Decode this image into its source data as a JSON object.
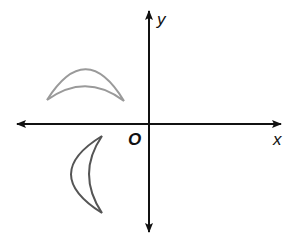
{
  "diagram": {
    "type": "coordinate-plane-transformation",
    "axes": {
      "x_label": "x",
      "y_label": "y",
      "origin_label": "O",
      "color": "#111111",
      "origin_px": [
        149,
        124
      ]
    },
    "figures": [
      {
        "name": "crescent-preimage",
        "quadrant": "II",
        "orientation": "opening-down",
        "stroke": "#9a9a9a",
        "tips_px": [
          [
            47,
            100
          ],
          [
            124,
            101
          ]
        ]
      },
      {
        "name": "crescent-image",
        "quadrant": "III",
        "orientation": "opening-right",
        "stroke": "#555555",
        "tips_px": [
          [
            102,
            136
          ],
          [
            102,
            213
          ]
        ]
      }
    ]
  }
}
